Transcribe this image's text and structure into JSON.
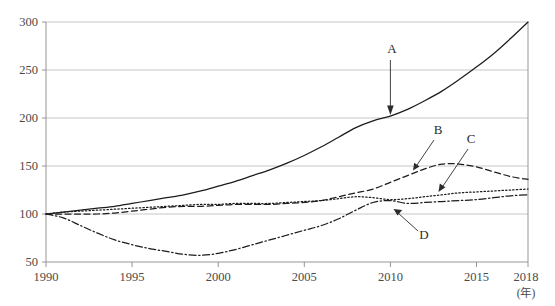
{
  "chart_data": {
    "type": "line",
    "title": "",
    "xlabel": "(年)",
    "ylabel": "",
    "xlim": [
      1990,
      2018
    ],
    "ylim": [
      50,
      300
    ],
    "grid": true,
    "legend": "inline-annotations",
    "index_base": "1990 = 100",
    "xticks": [
      1990,
      1995,
      2000,
      2005,
      2010,
      2015,
      2018
    ],
    "yticks": [
      50,
      100,
      150,
      200,
      250,
      300
    ],
    "x": [
      1990,
      1991,
      1992,
      1993,
      1994,
      1995,
      1996,
      1997,
      1998,
      1999,
      2000,
      2001,
      2002,
      2003,
      2004,
      2005,
      2006,
      2007,
      2008,
      2009,
      2010,
      2011,
      2012,
      2013,
      2014,
      2015,
      2016,
      2017,
      2018
    ],
    "series": [
      {
        "name": "A",
        "style": "solid",
        "values": [
          100,
          102,
          104,
          106,
          108,
          111,
          114,
          117,
          120,
          124,
          129,
          134,
          140,
          146,
          153,
          161,
          170,
          180,
          190,
          197,
          202,
          209,
          218,
          228,
          240,
          253,
          267,
          283,
          300
        ]
      },
      {
        "name": "B",
        "style": "dashed",
        "values": [
          100,
          100,
          100,
          100,
          101,
          103,
          105,
          107,
          108,
          108,
          109,
          110,
          110,
          110,
          111,
          112,
          114,
          118,
          122,
          126,
          133,
          140,
          147,
          152,
          152,
          149,
          144,
          139,
          136
        ]
      },
      {
        "name": "C",
        "style": "dotted",
        "values": [
          100,
          102,
          103,
          104,
          105,
          106,
          107,
          108,
          109,
          110,
          110,
          111,
          111,
          111,
          112,
          113,
          114,
          116,
          118,
          117,
          115,
          116,
          118,
          120,
          122,
          123,
          124,
          125,
          126
        ]
      },
      {
        "name": "D",
        "style": "dash-dot",
        "values": [
          100,
          96,
          88,
          80,
          73,
          68,
          64,
          61,
          58,
          57,
          59,
          63,
          68,
          73,
          78,
          83,
          88,
          95,
          104,
          112,
          114,
          111,
          112,
          113,
          114,
          115,
          117,
          119,
          120
        ]
      }
    ],
    "annotations": [
      {
        "label": "A",
        "target_year": 2010,
        "target_value": 202
      },
      {
        "label": "B",
        "target_year": 2011,
        "target_value": 140
      },
      {
        "label": "C",
        "target_year": 2012,
        "target_value": 118
      },
      {
        "label": "D",
        "target_year": 2010,
        "target_value": 114
      }
    ]
  },
  "axis": {
    "y_tick_labels": [
      "300",
      "250",
      "200",
      "150",
      "100",
      "50"
    ],
    "x_tick_labels": [
      "1990",
      "1995",
      "2000",
      "2005",
      "2010",
      "2015",
      "2018"
    ],
    "x_unit": "(年)"
  },
  "labels": {
    "a": "A",
    "b": "B",
    "c": "C",
    "d": "D"
  },
  "colors": {
    "line": "#1c1c1c",
    "grid": "#b9b9b9",
    "axis": "#8a8a8a",
    "text": "#3a3a3a",
    "background": "#ffffff"
  }
}
